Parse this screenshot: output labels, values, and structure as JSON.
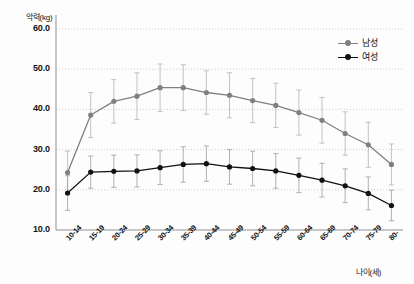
{
  "chart_data": {
    "type": "line",
    "title": "",
    "subtitle": "",
    "xlabel": "나이(세)",
    "ylabel": "악력(kg)",
    "categories": [
      "10-14",
      "15-19",
      "20-24",
      "25-29",
      "30-34",
      "35-39",
      "40-44",
      "45-49",
      "50-54",
      "55-59",
      "60-64",
      "65-69",
      "70-74",
      "75-79",
      "80-"
    ],
    "ylim": [
      10.0,
      60.0
    ],
    "ytick_labels": [
      "10.0",
      "20.0",
      "30.0",
      "40.0",
      "50.0",
      "60.0"
    ],
    "ytick_values": [
      10.0,
      20.0,
      30.0,
      40.0,
      50.0,
      60.0
    ],
    "grid": "horizontal-dotted",
    "legend_position": "top-right",
    "error_bars": "standard-deviation",
    "series": [
      {
        "name": "남성",
        "color": "#808080",
        "marker": "circle",
        "values": [
          24.3,
          38.6,
          42.0,
          43.3,
          45.4,
          45.4,
          44.2,
          43.5,
          42.2,
          41.0,
          39.2,
          37.3,
          34.0,
          31.2,
          26.3
        ],
        "err_low": [
          19.0,
          33.0,
          36.6,
          37.5,
          39.5,
          39.7,
          38.8,
          37.9,
          36.7,
          35.5,
          33.6,
          31.6,
          28.6,
          25.6,
          21.2
        ],
        "err_high": [
          29.6,
          44.2,
          47.4,
          49.1,
          51.3,
          51.1,
          49.6,
          49.1,
          47.7,
          46.5,
          44.8,
          43.0,
          39.4,
          36.8,
          31.4
        ]
      },
      {
        "name": "여성",
        "color": "#111111",
        "marker": "circle",
        "values": [
          19.2,
          24.4,
          24.6,
          24.7,
          25.5,
          26.3,
          26.5,
          25.7,
          25.3,
          24.7,
          23.6,
          22.4,
          21.0,
          19.1,
          16.1
        ],
        "err_low": [
          14.9,
          20.4,
          20.6,
          20.7,
          21.3,
          21.9,
          22.1,
          21.4,
          21.0,
          20.4,
          19.3,
          18.2,
          16.8,
          15.0,
          12.3
        ],
        "err_high": [
          23.5,
          28.4,
          28.6,
          28.7,
          29.7,
          30.7,
          30.9,
          30.0,
          29.6,
          29.0,
          27.9,
          26.6,
          25.2,
          23.2,
          19.9
        ]
      }
    ]
  },
  "axis": {
    "y_title": "악력(kg)",
    "x_title": "나이(세)"
  },
  "legend": {
    "items": [
      {
        "label": "남성",
        "color": "#808080"
      },
      {
        "label": "여성",
        "color": "#111111"
      }
    ]
  }
}
